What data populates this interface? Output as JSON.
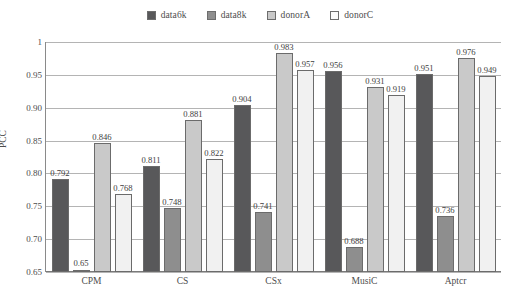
{
  "chart_data": {
    "type": "bar",
    "title": "",
    "xlabel": "",
    "ylabel": "PCC",
    "ylim": [
      0.65,
      1
    ],
    "yticks": [
      "0.65",
      "0.70",
      "0.75",
      "0.80",
      "0.85",
      "0.90",
      "0.95",
      "1"
    ],
    "ytick_values": [
      0.65,
      0.7,
      0.75,
      0.8,
      0.85,
      0.9,
      0.95,
      1
    ],
    "grid": true,
    "legend_position": "top-center",
    "categories": [
      "CPM",
      "CS",
      "CSx",
      "MusiC",
      "Aptcr"
    ],
    "series": [
      {
        "name": "data6k",
        "color": "#58585a",
        "values": [
          0.792,
          0.811,
          0.904,
          0.956,
          0.951
        ],
        "labels": [
          "0.792",
          "0.811",
          "0.904",
          "0.956",
          "0.951"
        ]
      },
      {
        "name": "data8k",
        "color": "#8e8e8e",
        "values": [
          0.65,
          0.748,
          0.741,
          0.688,
          0.736
        ],
        "labels": [
          "0.65",
          "0.748",
          "0.741",
          "0.688",
          "0.736"
        ]
      },
      {
        "name": "donorA",
        "color": "#c9c9c9",
        "values": [
          0.846,
          0.881,
          0.983,
          0.931,
          0.976
        ],
        "labels": [
          "0.846",
          "0.881",
          "0.983",
          "0.931",
          "0.976"
        ]
      },
      {
        "name": "donorC",
        "color": "#f1f1f1",
        "values": [
          0.768,
          0.822,
          0.957,
          0.919,
          0.949
        ],
        "labels": [
          "0.768",
          "0.822",
          "0.957",
          "0.919",
          "0.949"
        ]
      }
    ]
  },
  "legend": {
    "items": [
      {
        "label": "data6k",
        "color": "#58585a"
      },
      {
        "label": "data8k",
        "color": "#8e8e8e"
      },
      {
        "label": "donorA",
        "color": "#c9c9c9"
      },
      {
        "label": "donorC",
        "color": "#fbfbfb"
      }
    ]
  },
  "axis": {
    "y_title": "PCC"
  }
}
